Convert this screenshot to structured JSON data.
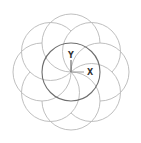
{
  "drawing": {
    "center": {
      "x": 71,
      "y": 72
    },
    "center_circle_radius": 29,
    "petal_count": 8,
    "petal_radius": 29,
    "colors": {
      "petal_stroke": "#b8b8b8",
      "center_stroke": "#6e6e6e",
      "axis": "#555555",
      "background": "#ffffff"
    }
  },
  "ucs_icon": {
    "x_label": "X",
    "y_label": "Y"
  }
}
